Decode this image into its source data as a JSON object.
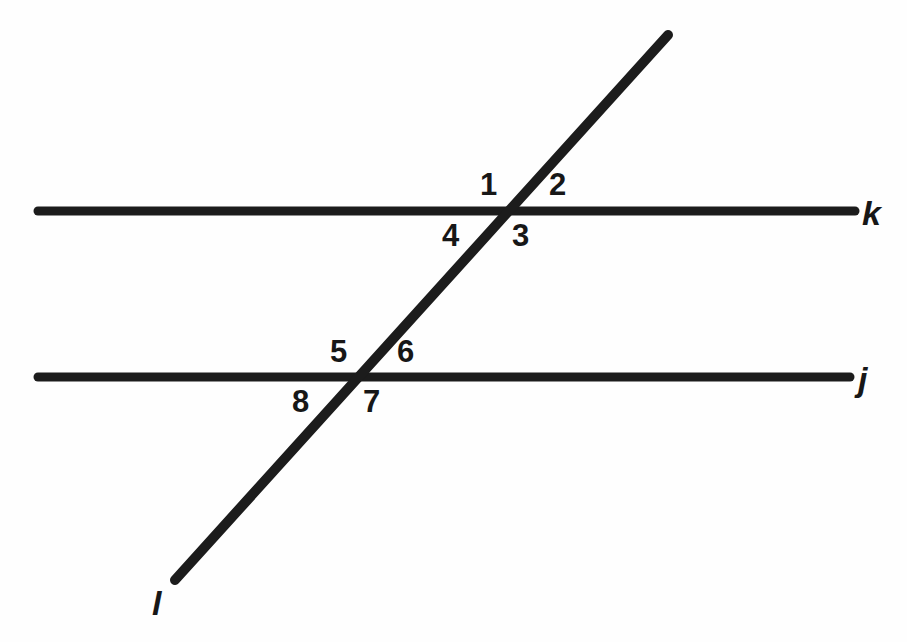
{
  "figure": {
    "background_color": "#fefefe",
    "stroke_color": "#1c1c1c",
    "label_color": "#171717",
    "width": 907,
    "height": 642
  },
  "lines": [
    {
      "id": "line-k",
      "label": "k",
      "role": "parallel-line-upper",
      "x1": 38,
      "y1": 211,
      "x2": 855,
      "y2": 211,
      "thickness": 9,
      "label_x": 862,
      "label_y": 196
    },
    {
      "id": "line-j",
      "label": "j",
      "role": "parallel-line-lower",
      "x1": 38,
      "y1": 377,
      "x2": 850,
      "y2": 377,
      "thickness": 9,
      "label_x": 858,
      "label_y": 362
    },
    {
      "id": "line-l",
      "label": "l",
      "role": "transversal",
      "x1": 668,
      "y1": 35,
      "x2": 175,
      "y2": 580,
      "thickness": 10,
      "label_x": 152,
      "label_y": 586
    }
  ],
  "intersections": [
    {
      "id": "intersection-upper",
      "lines": [
        "k",
        "l"
      ],
      "x": 510,
      "y": 211
    },
    {
      "id": "intersection-lower",
      "lines": [
        "j",
        "l"
      ],
      "x": 358,
      "y": 377
    }
  ],
  "angle_labels": [
    {
      "id": "angle-1",
      "text": "1",
      "x": 480,
      "y": 169,
      "intersection": "intersection-upper",
      "quadrant": "upper-left"
    },
    {
      "id": "angle-2",
      "text": "2",
      "x": 549,
      "y": 169,
      "intersection": "intersection-upper",
      "quadrant": "upper-right"
    },
    {
      "id": "angle-3",
      "text": "3",
      "x": 512,
      "y": 220,
      "intersection": "intersection-upper",
      "quadrant": "lower-right"
    },
    {
      "id": "angle-4",
      "text": "4",
      "x": 442,
      "y": 220,
      "intersection": "intersection-upper",
      "quadrant": "lower-left"
    },
    {
      "id": "angle-5",
      "text": "5",
      "x": 330,
      "y": 336,
      "intersection": "intersection-lower",
      "quadrant": "upper-left"
    },
    {
      "id": "angle-6",
      "text": "6",
      "x": 397,
      "y": 336,
      "intersection": "intersection-lower",
      "quadrant": "upper-right"
    },
    {
      "id": "angle-7",
      "text": "7",
      "x": 363,
      "y": 386,
      "intersection": "intersection-lower",
      "quadrant": "lower-right"
    },
    {
      "id": "angle-8",
      "text": "8",
      "x": 292,
      "y": 386,
      "intersection": "intersection-lower",
      "quadrant": "lower-left"
    }
  ]
}
